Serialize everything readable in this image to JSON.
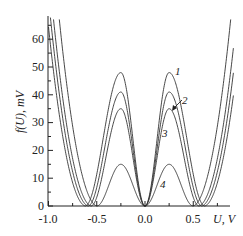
{
  "chart_data": {
    "type": "line",
    "title": "",
    "xlabel": "U, V",
    "ylabel": "f(U), mV",
    "xlim": [
      -1.0,
      0.9
    ],
    "ylim": [
      0,
      68
    ],
    "grid": false,
    "x_ticks": [
      "-1.0",
      "-0.5",
      "0.0",
      "0.5"
    ],
    "y_ticks": [
      "0",
      "10",
      "20",
      "30",
      "40",
      "50",
      "60"
    ],
    "legend": "inline curve numbers",
    "series": [
      {
        "name": "1",
        "peak_x": [
          -0.25,
          0.25
        ],
        "peak_y": 48,
        "outer_min_x": [
          -0.62,
          0.62
        ],
        "center_min": [
          0.0,
          0
        ]
      },
      {
        "name": "2",
        "peak_x": [
          -0.25,
          0.25
        ],
        "peak_y": 41,
        "outer_min_x": [
          -0.59,
          0.59
        ],
        "center_min": [
          0.0,
          0
        ]
      },
      {
        "name": "3",
        "peak_x": [
          -0.25,
          0.25
        ],
        "peak_y": 35,
        "outer_min_x": [
          -0.56,
          0.56
        ],
        "center_min": [
          0.0,
          0
        ]
      },
      {
        "name": "4",
        "peak_x": [
          -0.25,
          0.25
        ],
        "peak_y": 15,
        "outer_min_x": [
          -0.5,
          0.5
        ],
        "center_min": [
          0.0,
          0
        ]
      }
    ],
    "annotations": [
      {
        "text": "1",
        "x": 0.33,
        "y": 50
      },
      {
        "text": "2",
        "x": 0.42,
        "y": 43,
        "arrow_to": [
          0.3,
          38
        ]
      },
      {
        "text": "3",
        "x": 0.3,
        "y": 28
      },
      {
        "text": "4",
        "x": 0.3,
        "y": 8
      }
    ]
  },
  "labels": {
    "xlabel": "U, V",
    "ylabel": "f(U), mV",
    "x_ticks": [
      "-1.0",
      "-0.5",
      "0.0",
      "0.5"
    ],
    "y_ticks": [
      "0",
      "10",
      "20",
      "30",
      "40",
      "50",
      "60"
    ],
    "curves": [
      "1",
      "2",
      "3",
      "4"
    ]
  }
}
